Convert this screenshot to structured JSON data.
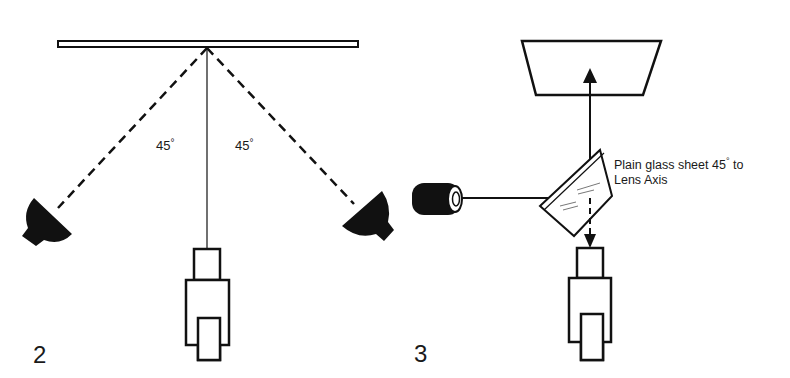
{
  "figure2": {
    "number": "2",
    "angle_left": "45",
    "angle_right": "45",
    "degree": "°"
  },
  "figure3": {
    "number": "3",
    "note_line1": "Plain glass sheet 45",
    "note_degree": "°",
    "note_line1_end": " to",
    "note_line2": "Lens Axis"
  },
  "colors": {
    "ink": "#111111",
    "background": "#ffffff"
  }
}
